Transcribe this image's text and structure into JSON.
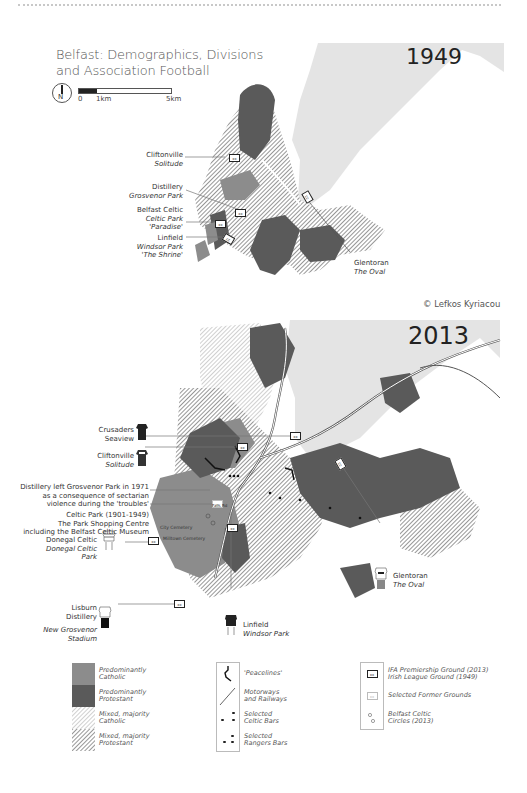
{
  "title": {
    "line1": "Belfast: Demographics, Divisions",
    "line2": "and Association Football"
  },
  "compass": {
    "label": "N"
  },
  "scale": {
    "labels": [
      "0",
      "1km",
      "5km"
    ]
  },
  "maps": {
    "map1949": {
      "year": "1949",
      "grounds": [
        {
          "club": "Cliftonville",
          "ground": "Solitude"
        },
        {
          "club": "Distillery",
          "ground": "Grosvenor Park"
        },
        {
          "club": "Belfast Celtic",
          "ground": "Celtic Park",
          "nickname": "'Paradise'"
        },
        {
          "club": "Linfield",
          "ground": "Windsor Park",
          "nickname": "'The Shrine'"
        },
        {
          "club": "Glentoran",
          "ground": "The Oval"
        }
      ],
      "credit": "© Lefkos Kyriacou"
    },
    "map2013": {
      "year": "2013",
      "grounds": [
        {
          "club": "Crusaders",
          "ground": "Seaview"
        },
        {
          "club": "Cliftonville",
          "ground": "Solitude"
        },
        {
          "club": "Donegal Celtic",
          "ground": "Donegal Celtic Park"
        },
        {
          "club": "Lisburn Distillery",
          "ground": "New Grosvenor Stadium"
        },
        {
          "club": "Linfield",
          "ground": "Windsor Park"
        },
        {
          "club": "Glentoran",
          "ground": "The Oval"
        }
      ],
      "notes": {
        "distillery": [
          "Distillery left Grosvenor Park in 1971",
          "as a consequence of sectarian",
          "violence during the 'troubles'"
        ],
        "celtic_park": [
          "Celtic Park (1901-1949)",
          "The Park Shopping Centre",
          "including the Belfast Celtic Museum"
        ]
      },
      "place_labels": {
        "city_cemetery": "City Cemetery",
        "milltown_cemetery": "Milltown Cemetery",
        "falls_rd": "Falls Rd"
      }
    }
  },
  "legend": {
    "areas": [
      {
        "label1": "Predominantly",
        "label2": "Catholic",
        "color": "#8c8c8c",
        "pattern": "solid"
      },
      {
        "label1": "Predominantly",
        "label2": "Protestant",
        "color": "#5a5a5a",
        "pattern": "solid"
      },
      {
        "label1": "Mixed, majority",
        "label2": "Catholic",
        "color": "#c9c9c9",
        "pattern": "hatch-light"
      },
      {
        "label1": "Mixed, majority",
        "label2": "Protestant",
        "color": "#9a9a9a",
        "pattern": "hatch-dark"
      }
    ],
    "lines": [
      {
        "label1": "'Peacelines'",
        "label2": "",
        "icon": "peaceline-icon"
      },
      {
        "label1": "Motorways",
        "label2": "and Railways",
        "icon": "motorway-icon"
      },
      {
        "label1": "Selected",
        "label2": "Celtic Bars",
        "icon": "celtic-bars-icon"
      },
      {
        "label1": "Selected",
        "label2": "Rangers Bars",
        "icon": "rangers-bars-icon"
      }
    ],
    "grounds": [
      {
        "label1": "IFA Premiership Ground (2013)",
        "label2": "Irish League Ground (1949)",
        "icon": "ground-icon"
      },
      {
        "label1": "Selected Former Grounds",
        "label2": "",
        "icon": "former-ground-icon"
      },
      {
        "label1": "Belfast Celtic",
        "label2": "Circles (2013)",
        "icon": "circles-icon"
      }
    ]
  },
  "colors": {
    "water": "#e4e4e4",
    "catholic": "#8c8c8c",
    "protestant": "#5a5a5a",
    "mixed_catholic": "#c9c9c9",
    "mixed_protestant": "#9a9a9a",
    "text": "#333333"
  }
}
